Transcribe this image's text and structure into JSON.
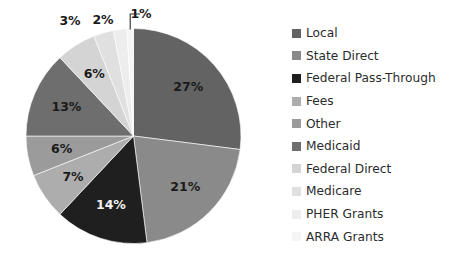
{
  "chart_data": {
    "type": "pie",
    "title": "",
    "subtitle": "",
    "xlabel": "",
    "ylabel": "",
    "legend_position": "right",
    "grid": false,
    "start_angle_deg": 0,
    "direction": "clockwise",
    "categories": [
      "Local",
      "State Direct",
      "Federal Pass-Through",
      "Fees",
      "Other",
      "Medicaid",
      "Federal Direct",
      "Medicare",
      "PHER Grants",
      "ARRA Grants"
    ],
    "values": [
      27,
      21,
      14,
      7,
      6,
      13,
      6,
      3,
      2,
      1
    ],
    "value_unit": "%",
    "data_labels": [
      "27%",
      "21%",
      "14%",
      "7%",
      "6%",
      "13%",
      "6%",
      "3%",
      "2%",
      "1%"
    ],
    "colors": [
      "#636363",
      "#8a8a8a",
      "#1f1f1f",
      "#adadad",
      "#9b9b9b",
      "#6e6e6e",
      "#d4d4d4",
      "#e0e0e0",
      "#ededed",
      "#f5f5f5"
    ],
    "slices": [
      {
        "label": "Local",
        "value": 27,
        "display": "27%",
        "color": "#636363",
        "label_fill": "#1a1a1a",
        "label_outside": false
      },
      {
        "label": "State Direct",
        "value": 21,
        "display": "21%",
        "color": "#8a8a8a",
        "label_fill": "#1a1a1a",
        "label_outside": false
      },
      {
        "label": "Federal Pass-Through",
        "value": 14,
        "display": "14%",
        "color": "#1f1f1f",
        "label_fill": "#f2f2f2",
        "label_outside": false
      },
      {
        "label": "Fees",
        "value": 7,
        "display": "7%",
        "color": "#adadad",
        "label_fill": "#1a1a1a",
        "label_outside": false
      },
      {
        "label": "Other",
        "value": 6,
        "display": "6%",
        "color": "#9b9b9b",
        "label_fill": "#1a1a1a",
        "label_outside": false
      },
      {
        "label": "Medicaid",
        "value": 13,
        "display": "13%",
        "color": "#6e6e6e",
        "label_fill": "#1a1a1a",
        "label_outside": false
      },
      {
        "label": "Federal Direct",
        "value": 6,
        "display": "6%",
        "color": "#d4d4d4",
        "label_fill": "#1a1a1a",
        "label_outside": false
      },
      {
        "label": "Medicare",
        "value": 3,
        "display": "3%",
        "color": "#e0e0e0",
        "label_fill": "#1a1a1a",
        "label_outside": true
      },
      {
        "label": "PHER Grants",
        "value": 2,
        "display": "2%",
        "color": "#ededed",
        "label_fill": "#1a1a1a",
        "label_outside": true
      },
      {
        "label": "ARRA Grants",
        "value": 1,
        "display": "1%",
        "color": "#f5f5f5",
        "label_fill": "#1a1a1a",
        "label_outside": true
      }
    ]
  },
  "legend": {
    "items": [
      {
        "label": "Local",
        "color": "#636363"
      },
      {
        "label": "State Direct",
        "color": "#8a8a8a"
      },
      {
        "label": "Federal Pass-Through",
        "color": "#1f1f1f"
      },
      {
        "label": "Fees",
        "color": "#adadad"
      },
      {
        "label": "Other",
        "color": "#9b9b9b"
      },
      {
        "label": "Medicaid",
        "color": "#6e6e6e"
      },
      {
        "label": "Federal Direct",
        "color": "#d4d4d4"
      },
      {
        "label": "Medicare",
        "color": "#e0e0e0"
      },
      {
        "label": "PHER Grants",
        "color": "#ededed"
      },
      {
        "label": "ARRA Grants",
        "color": "#f5f5f5"
      }
    ]
  }
}
